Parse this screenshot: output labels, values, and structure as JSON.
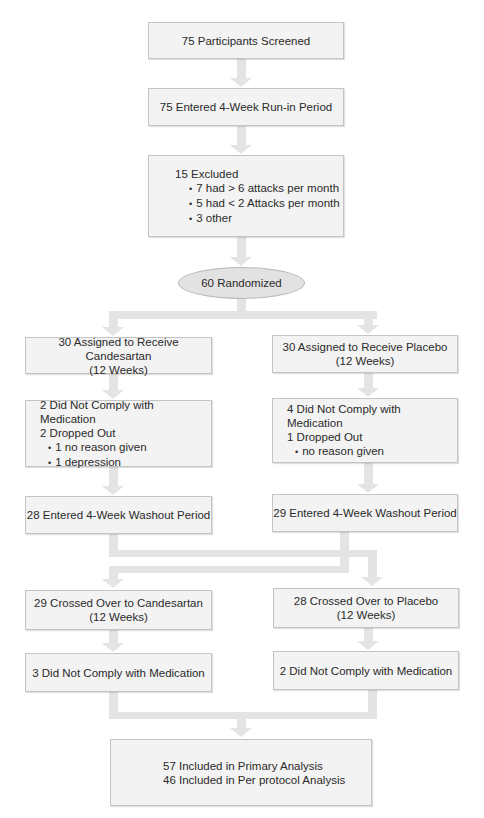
{
  "flowchart": {
    "screened": "75 Participants Screened",
    "run_in": "75 Entered 4-Week Run-in Period",
    "excluded": {
      "title": "15 Excluded",
      "reasons": [
        "7 had > 6 attacks per month",
        "5 had < 2 Attacks per month",
        "3 other"
      ]
    },
    "randomized": "60 Randomized",
    "candesartan_arm": {
      "assigned": [
        "30 Assigned to Receive Candesartan",
        "(12 Weeks)"
      ],
      "attrition": {
        "lines": [
          "2 Did Not Comply with Medication",
          "2 Dropped Out"
        ],
        "reasons": [
          "1 no reason given",
          "1 depression"
        ]
      },
      "washout": "28 Entered 4-Week Washout Period",
      "crossover": [
        "28 Crossed Over to Placebo",
        "(12 Weeks)"
      ],
      "crossover_attrition": "2 Did Not Comply with Medication"
    },
    "placebo_arm": {
      "assigned": [
        "30 Assigned to Receive Placebo",
        "(12 Weeks)"
      ],
      "attrition": {
        "lines": [
          "4 Did Not Comply with Medication",
          "1 Dropped Out"
        ],
        "reasons": [
          "no reason given"
        ]
      },
      "washout": "29 Entered 4-Week Washout Period",
      "crossover": [
        "29 Crossed Over to Candesartan",
        "(12 Weeks)"
      ],
      "crossover_attrition": "3 Did Not Comply with Medication"
    },
    "analysis": [
      "57 Included in Primary Analysis",
      "46 Included in Per protocol Analysis"
    ]
  },
  "colors": {
    "box_fill": "#f3f3f3",
    "box_border": "#c4c4c4",
    "connector": "#e4e4e4",
    "ellipse_fill": "#e2e2e2",
    "text": "#2a2a2a"
  }
}
